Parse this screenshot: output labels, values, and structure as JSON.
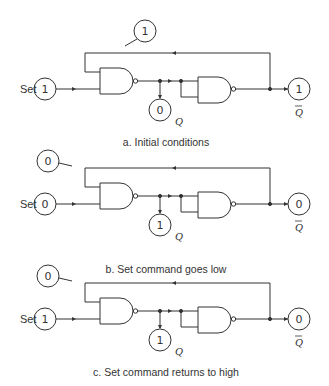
{
  "panels": [
    {
      "id": "a",
      "caption": "a. Initial conditions",
      "set_label": "Set",
      "set_value": "1",
      "feedback_value": "1",
      "q_value": "0",
      "qbar_value": "1",
      "q_label": "Q",
      "qbar_label": "Q"
    },
    {
      "id": "b",
      "caption": "b. Set command goes low",
      "set_label": "Set",
      "set_value": "0",
      "feedback_value": "0",
      "q_value": "1",
      "qbar_value": "0",
      "q_label": "Q",
      "qbar_label": "Q"
    },
    {
      "id": "c",
      "caption": "c. Set command returns to high",
      "set_label": "Set",
      "set_value": "1",
      "feedback_value": "0",
      "q_value": "1",
      "qbar_value": "0",
      "q_label": "Q",
      "qbar_label": "Q"
    }
  ],
  "colors": {
    "line": "#333333",
    "background": "#ffffff"
  }
}
